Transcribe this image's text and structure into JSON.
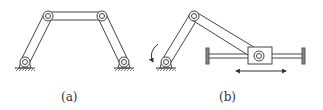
{
  "figure": {
    "panels": [
      {
        "id": "a",
        "label": "(a)",
        "description": "four-bar linkage"
      },
      {
        "id": "b",
        "label": "(b)",
        "description": "slider-crank mechanism"
      }
    ],
    "colors": {
      "line": "#444444",
      "fill": "#ffffff",
      "background": "#ffffff"
    }
  }
}
